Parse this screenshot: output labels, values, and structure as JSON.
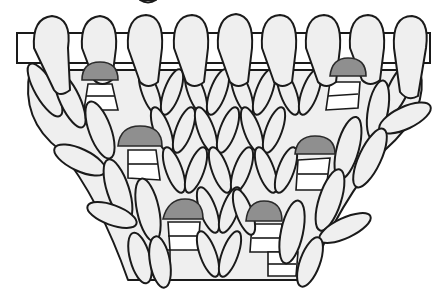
{
  "figure": {
    "colors": {
      "yarn_fill": "#efefef",
      "outline": "#1a1a1a",
      "marker_fill": "#8f8f8f",
      "background": "#ffffff"
    },
    "needle": {
      "x1": 17,
      "x2": 430,
      "y_top": 33,
      "y_bottom": 63
    },
    "loops_on_needle_x": [
      50,
      98,
      145,
      190,
      235,
      280,
      325,
      370,
      412
    ],
    "markers": [
      {
        "id": "marker-1",
        "cx": 100,
        "cy": 72,
        "w": 36,
        "h": 18
      },
      {
        "id": "marker-2",
        "cx": 348,
        "cy": 67,
        "w": 36,
        "h": 17
      },
      {
        "id": "marker-3",
        "cx": 140,
        "cy": 136,
        "w": 44,
        "h": 20
      },
      {
        "id": "marker-4",
        "cx": 315,
        "cy": 145,
        "w": 40,
        "h": 18
      },
      {
        "id": "marker-5",
        "cx": 183,
        "cy": 209,
        "w": 40,
        "h": 20
      },
      {
        "id": "marker-6",
        "cx": 264,
        "cy": 211,
        "w": 36,
        "h": 20
      }
    ]
  }
}
